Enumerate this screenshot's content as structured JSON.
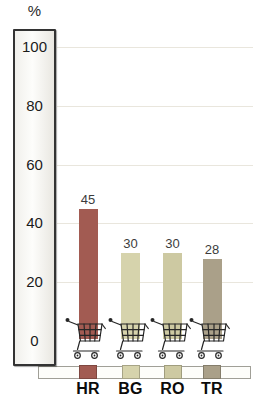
{
  "axis": {
    "unit_label": "%",
    "tick_labels": [
      "100",
      "80",
      "60",
      "40",
      "20",
      "0"
    ]
  },
  "chart_data": {
    "type": "bar",
    "title": "",
    "xlabel": "",
    "ylabel": "%",
    "ylim": [
      0,
      100
    ],
    "grid": true,
    "legend_position": "none",
    "categories": [
      "HR",
      "BG",
      "RO",
      "TR"
    ],
    "values": [
      45,
      30,
      30,
      28
    ],
    "value_labels": [
      "45",
      "30",
      "30",
      "28"
    ],
    "bar_colors": [
      "#a25b52",
      "#d6d3ac",
      "#cdc9a2",
      "#aaa089"
    ],
    "legend_square_colors": [
      "#a25b52",
      "#d6d3ac",
      "#cdc9a2",
      "#aaa089"
    ],
    "bar_base_icon": "shopping-cart-icon"
  },
  "colors": {
    "background": "#ffffff",
    "grid_line": "#e9e6dd",
    "scale_box_border": "#333333",
    "floor_border": "#a09f97",
    "cart_stroke": "#262626",
    "value_label_text": "#3c3c3c",
    "category_label_text": "#0b0b0b"
  }
}
